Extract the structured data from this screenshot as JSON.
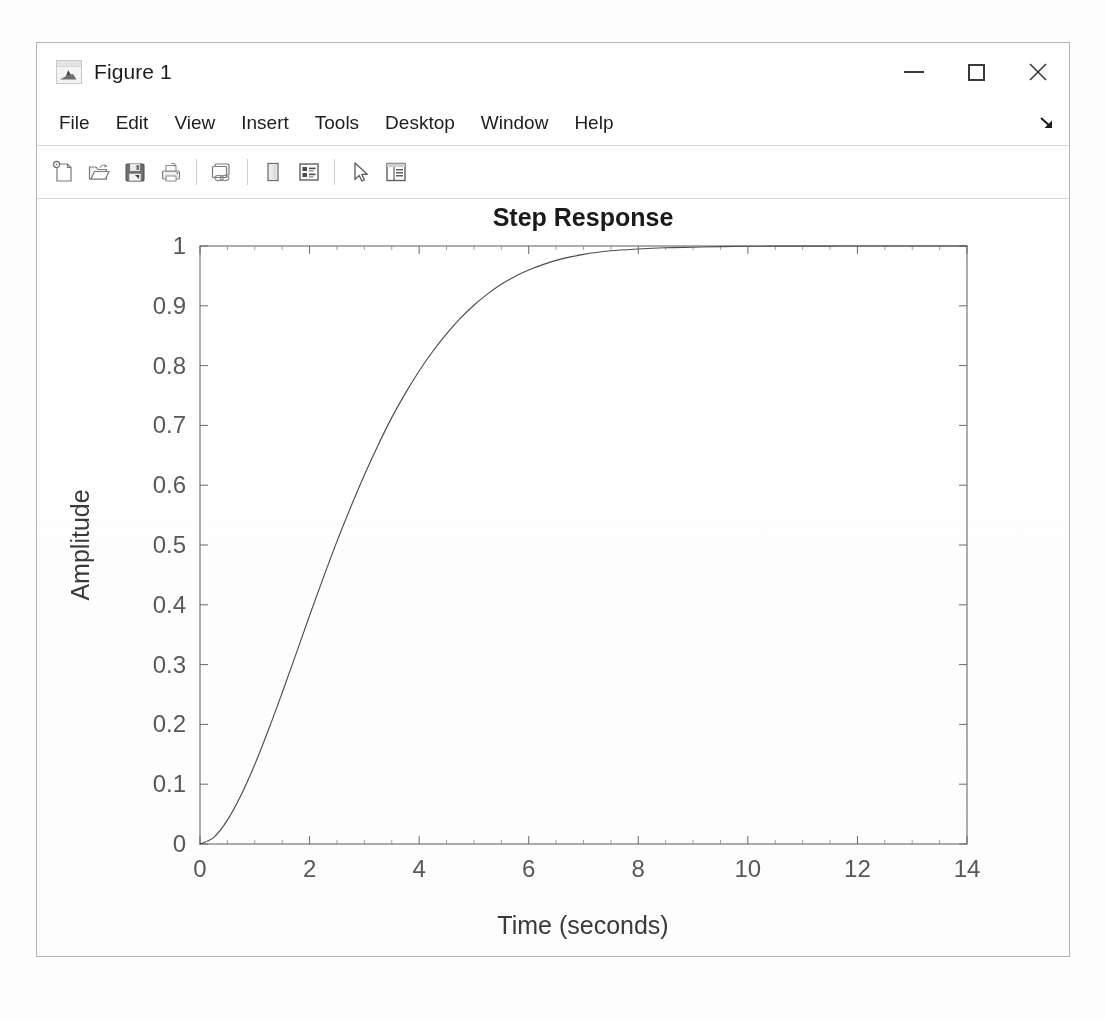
{
  "window": {
    "title": "Figure 1",
    "icon": "matlab-membrane-icon",
    "controls": [
      {
        "name": "minimize-button",
        "glyph": "minimize-icon",
        "label": "Minimize"
      },
      {
        "name": "maximize-button",
        "glyph": "maximize-icon",
        "label": "Maximize"
      },
      {
        "name": "close-button",
        "glyph": "close-icon",
        "label": "Close"
      }
    ],
    "close_symbol": "✕"
  },
  "menu": {
    "items": [
      {
        "label": "File"
      },
      {
        "label": "Edit"
      },
      {
        "label": "View"
      },
      {
        "label": "Insert"
      },
      {
        "label": "Tools"
      },
      {
        "label": "Desktop"
      },
      {
        "label": "Window"
      },
      {
        "label": "Help"
      }
    ],
    "dock_control": {
      "name": "undock-arrow-icon",
      "symbol": "↘"
    }
  },
  "toolbar": {
    "buttons": [
      {
        "name": "new-figure-button",
        "icon": "new-figure-icon",
        "tooltip": "New Figure"
      },
      {
        "name": "open-file-button",
        "icon": "open-folder-icon",
        "tooltip": "Open File"
      },
      {
        "name": "save-figure-button",
        "icon": "save-disk-icon",
        "tooltip": "Save Figure"
      },
      {
        "name": "print-figure-button",
        "icon": "printer-icon",
        "tooltip": "Print Figure"
      },
      {
        "name": "separator-1",
        "icon": "separator",
        "tooltip": ""
      },
      {
        "name": "link-plot-button",
        "icon": "link-plot-icon",
        "tooltip": "Link Plot"
      },
      {
        "name": "separator-2",
        "icon": "separator",
        "tooltip": ""
      },
      {
        "name": "insert-colorbar-button",
        "icon": "colorbar-icon",
        "tooltip": "Insert Colorbar"
      },
      {
        "name": "insert-legend-button",
        "icon": "legend-icon",
        "tooltip": "Insert Legend"
      },
      {
        "name": "separator-3",
        "icon": "separator",
        "tooltip": ""
      },
      {
        "name": "edit-plot-button",
        "icon": "pointer-arrow-icon",
        "tooltip": "Edit Plot"
      },
      {
        "name": "show-property-inspector-button",
        "icon": "property-inspector-icon",
        "tooltip": "Show Plot Tools and Dock Figure"
      }
    ]
  },
  "chart_data": {
    "type": "line",
    "title": "Step Response",
    "xlabel": "Time (seconds)",
    "ylabel": "Amplitude",
    "xlim": [
      0,
      14
    ],
    "ylim": [
      0,
      1
    ],
    "xticks": [
      0,
      2,
      4,
      6,
      8,
      10,
      12,
      14
    ],
    "xticklabels": [
      "0",
      "2",
      "4",
      "6",
      "8",
      "10",
      "12",
      "14"
    ],
    "yticks": [
      0,
      0.1,
      0.2,
      0.3,
      0.4,
      0.5,
      0.6,
      0.7,
      0.8,
      0.9,
      1
    ],
    "yticklabels": [
      "0",
      "0.1",
      "0.2",
      "0.3",
      "0.4",
      "0.5",
      "0.6",
      "0.7",
      "0.8",
      "0.9",
      "1"
    ],
    "grid": false,
    "legend": null,
    "box": true,
    "minor_ticks": true,
    "line_color": "#4d4d4d",
    "line_width": 1,
    "series": [
      {
        "name": "step",
        "x": [
          0,
          0.25,
          0.5,
          0.75,
          1,
          1.25,
          1.5,
          1.75,
          2,
          2.25,
          2.5,
          2.75,
          3,
          3.25,
          3.5,
          3.75,
          4,
          4.25,
          4.5,
          4.75,
          5,
          5.25,
          5.5,
          5.75,
          6,
          6.5,
          7,
          7.5,
          8,
          8.5,
          9,
          9.5,
          10,
          10.5,
          11,
          11.5,
          12,
          12.5,
          13,
          13.5,
          14
        ],
        "y": [
          0,
          0.011,
          0.04,
          0.082,
          0.133,
          0.191,
          0.253,
          0.317,
          0.382,
          0.445,
          0.506,
          0.563,
          0.617,
          0.667,
          0.713,
          0.754,
          0.791,
          0.824,
          0.853,
          0.879,
          0.901,
          0.92,
          0.936,
          0.949,
          0.96,
          0.976,
          0.986,
          0.992,
          0.995,
          0.997,
          0.998,
          0.999,
          0.9995,
          0.9997,
          0.9998,
          0.9999,
          1,
          1,
          1,
          1,
          1
        ]
      }
    ]
  }
}
